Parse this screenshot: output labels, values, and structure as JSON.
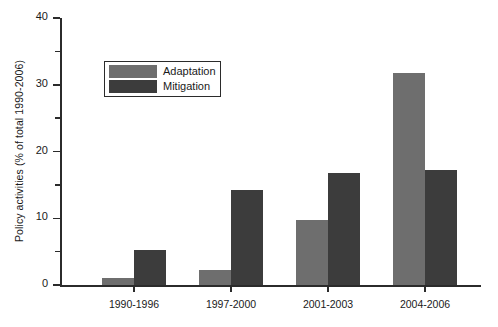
{
  "chart_data": {
    "type": "bar",
    "title": "",
    "subtitle": "",
    "xlabel": "",
    "ylabel": "Policy activities (% of total 1990-2006)",
    "categories": [
      "1990-1996",
      "1997-2000",
      "2001-2003",
      "2004-2006"
    ],
    "series": [
      {
        "name": "Adaptation",
        "color": "#6e6e6e",
        "values": [
          1.0,
          2.3,
          9.8,
          31.7
        ]
      },
      {
        "name": "Mitigation",
        "color": "#3c3c3c",
        "values": [
          5.3,
          14.3,
          16.8,
          17.2
        ]
      }
    ],
    "ylim": [
      0,
      40
    ],
    "ytick_labels": [
      "0",
      "10",
      "20",
      "30",
      "40"
    ],
    "ytick_values": [
      0,
      10,
      20,
      30,
      40
    ],
    "yminor_tick_values": [
      5,
      15,
      25,
      35
    ],
    "grid": false,
    "legend_position": "upper-left-inside",
    "legend_entries": [
      "Adaptation",
      "Mitigation"
    ]
  }
}
